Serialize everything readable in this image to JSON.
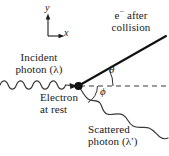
{
  "figure": {
    "axes": {
      "y_label": "y",
      "x_label": "x"
    },
    "labels": {
      "incident_line1": "Incident",
      "incident_line2": "photon (λ)",
      "electron_line1": "Electron",
      "electron_line2": "at rest",
      "electron_after_line1": "e− after",
      "electron_after_line1_base": "e",
      "electron_after_line1_sup": "−",
      "electron_after_line1_rest": " after",
      "electron_after_line2": "collision",
      "scattered_line1": "Scattered",
      "scattered_line2": "photon (λ′)",
      "angle_theta": "θ",
      "angle_phi": "ϕ"
    },
    "colors": {
      "ink": "#1a1a1a",
      "background": "#ffffff",
      "wave": "#3a3a3a",
      "dashed": "#3a3a3a"
    },
    "geometry": {
      "origin_dot_x": 78,
      "origin_dot_y": 86,
      "axis_origin_x": 48,
      "axis_origin_y": 36,
      "electron_ray_end_x": 166,
      "electron_ray_end_y": 36,
      "dashed_line_end_x": 168,
      "scattered_wave_end_x": 168,
      "scattered_wave_end_y": 122
    }
  }
}
